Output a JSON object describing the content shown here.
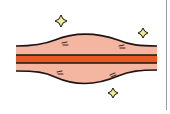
{
  "illustration": {
    "subject": "stretched spindle shape with central red band and sparkles",
    "colors": {
      "background": "#ffffff",
      "body_fill": "#f4b6a0",
      "band_fill": "#e8582a",
      "outline": "#1c1410",
      "sparkle_fill": "#ecec94",
      "frame_line": "#9a9a9a"
    },
    "sparkles": [
      {
        "x": 61,
        "y": 21
      },
      {
        "x": 143,
        "y": 33
      },
      {
        "x": 113,
        "y": 93
      }
    ],
    "marks": [
      {
        "x": 65,
        "y": 44
      },
      {
        "x": 122,
        "y": 47
      },
      {
        "x": 60,
        "y": 73
      },
      {
        "x": 113,
        "y": 75
      }
    ]
  }
}
